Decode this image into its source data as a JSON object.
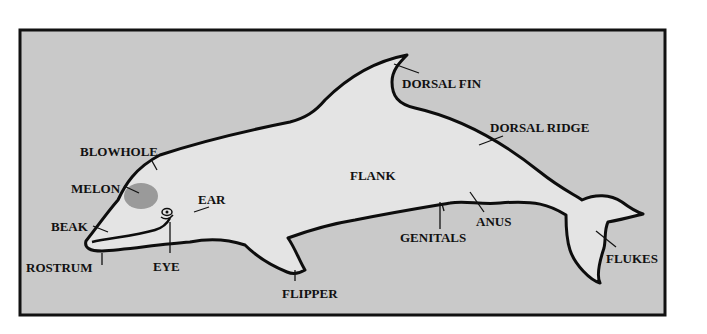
{
  "diagram": {
    "colors": {
      "page_background": "#ffffff",
      "panel_background": "#c9c9c9",
      "panel_border": "#111111",
      "body_fill": "#e4e4e4",
      "melon_fill": "#9a9a9a",
      "outline": "#0d0d0d"
    },
    "labels": {
      "blowhole": "BLOWHOLE",
      "melon": "MELON",
      "beak": "BEAK",
      "rostrum": "ROSTRUM",
      "eye": "EYE",
      "ear": "EAR",
      "flipper": "FLIPPER",
      "flank": "FLANK",
      "dorsal_fin": "DORSAL FIN",
      "dorsal_ridge": "DORSAL RIDGE",
      "genitals": "GENITALS",
      "anus": "ANUS",
      "flukes": "FLUKES"
    }
  }
}
